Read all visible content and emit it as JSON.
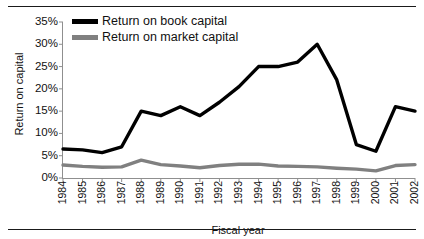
{
  "chart_data": {
    "type": "line",
    "title": "",
    "xlabel": "Fiscal year",
    "ylabel": "Return on capital",
    "categories": [
      "1984",
      "1985",
      "1986",
      "1987",
      "1988",
      "1989",
      "1990",
      "1991",
      "1992",
      "1993",
      "1994",
      "1995",
      "1996",
      "1997",
      "1998",
      "1999",
      "2000",
      "2001",
      "2002"
    ],
    "ylim": [
      0,
      35
    ],
    "ytick_labels": [
      "0%",
      "5%",
      "10%",
      "15%",
      "20%",
      "25%",
      "30%",
      "35%"
    ],
    "ytick_values": [
      0,
      5,
      10,
      15,
      20,
      25,
      30,
      35
    ],
    "grid": false,
    "legend_position": "top-left",
    "series": [
      {
        "name": "Return on book capital",
        "color": "#000000",
        "values": [
          6.5,
          6.3,
          5.7,
          7.0,
          15.0,
          14.0,
          16.0,
          14.0,
          17.0,
          20.5,
          25.0,
          25.0,
          26.0,
          30.0,
          22.0,
          7.5,
          6.0,
          16.0,
          15.0
        ]
      },
      {
        "name": "Return on market capital",
        "color": "#808080",
        "values": [
          2.9,
          2.6,
          2.4,
          2.5,
          4.0,
          3.0,
          2.7,
          2.3,
          2.8,
          3.1,
          3.1,
          2.7,
          2.6,
          2.5,
          2.2,
          2.0,
          1.6,
          2.8,
          3.0
        ]
      }
    ]
  },
  "legend": {
    "items": [
      {
        "label": "Return on book capital",
        "color": "#000000"
      },
      {
        "label": "Return on market capital",
        "color": "#808080"
      }
    ]
  },
  "axes": {
    "y_title": "Return on capital",
    "x_title": "Fiscal year"
  }
}
